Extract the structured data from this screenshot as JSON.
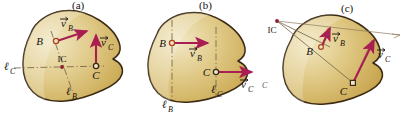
{
  "figure": {
    "panels": [
      {
        "id": "a",
        "caption": "(a)",
        "description": "Velocity vectors at B and C are non-parallel; perpendicular construction lines meet at the IC inside the body.",
        "points": [
          {
            "name": "B",
            "label": "B",
            "marker": "open-circle"
          },
          {
            "name": "C",
            "label": "C",
            "marker": "open-circle"
          },
          {
            "name": "IC",
            "label": "IC",
            "marker": "dot"
          }
        ],
        "vectors": [
          {
            "name": "vB",
            "label_v": "v",
            "label_sub": "B",
            "direction": "up-right"
          },
          {
            "name": "vC",
            "label_v": "v",
            "label_sub": "C",
            "direction": "up"
          }
        ],
        "construction_lines": [
          {
            "name": "lB",
            "label_l": "ℓ",
            "label_sub": "B",
            "orientation": "diagonal"
          },
          {
            "name": "lC",
            "label_l": "ℓ",
            "label_sub": "C",
            "orientation": "horizontal"
          }
        ]
      },
      {
        "id": "b",
        "caption": "(b)",
        "description": "Velocity vectors at B and C are parallel and equal; construction lines are parallel so the IC is at infinity.",
        "points": [
          {
            "name": "B",
            "label": "B",
            "marker": "open-circle"
          },
          {
            "name": "C",
            "label": "C",
            "marker": "open-circle"
          }
        ],
        "vectors": [
          {
            "name": "vB",
            "label_v": "v",
            "label_sub": "B",
            "direction": "right"
          },
          {
            "name": "vC",
            "label_v": "v",
            "label_sub": "C",
            "direction": "right"
          }
        ],
        "construction_lines": [
          {
            "name": "lB",
            "label_l": "ℓ",
            "label_sub": "B",
            "orientation": "vertical"
          },
          {
            "name": "lC",
            "label_l": "ℓ",
            "label_sub": "C",
            "orientation": "vertical"
          }
        ]
      },
      {
        "id": "c",
        "caption": "(c)",
        "description": "Velocity vectors at B and C are parallel but unequal; construction lines converge to an IC located outside the body.",
        "points": [
          {
            "name": "B",
            "label": "B",
            "marker": "open-circle"
          },
          {
            "name": "C",
            "label": "C",
            "marker": "open-square"
          },
          {
            "name": "IC",
            "label": "IC",
            "marker": "dot"
          }
        ],
        "vectors": [
          {
            "name": "vB",
            "label_v": "v",
            "label_sub": "B",
            "direction": "up-right"
          },
          {
            "name": "vC",
            "label_v": "v",
            "label_sub": "C",
            "direction": "up-right"
          }
        ],
        "construction_lines": [
          {
            "name": "lB",
            "label_l": "ℓ",
            "label_sub": "B",
            "orientation": "diagonal"
          },
          {
            "name": "lC",
            "label_l": "ℓ",
            "label_sub": "C",
            "orientation": "diagonal"
          }
        ]
      }
    ],
    "colors": {
      "body_fill_light": "#eadfb4",
      "body_fill_mid": "#ddc579",
      "body_fill_dark": "#c9a84f",
      "body_outline": "#3b2a13",
      "vector": "#a81e52",
      "vector_dark": "#8e1442",
      "construction_line": "#6e5c3f",
      "ic_dot": "#8a2030",
      "text": "#171310",
      "background": "#ffffff"
    }
  }
}
